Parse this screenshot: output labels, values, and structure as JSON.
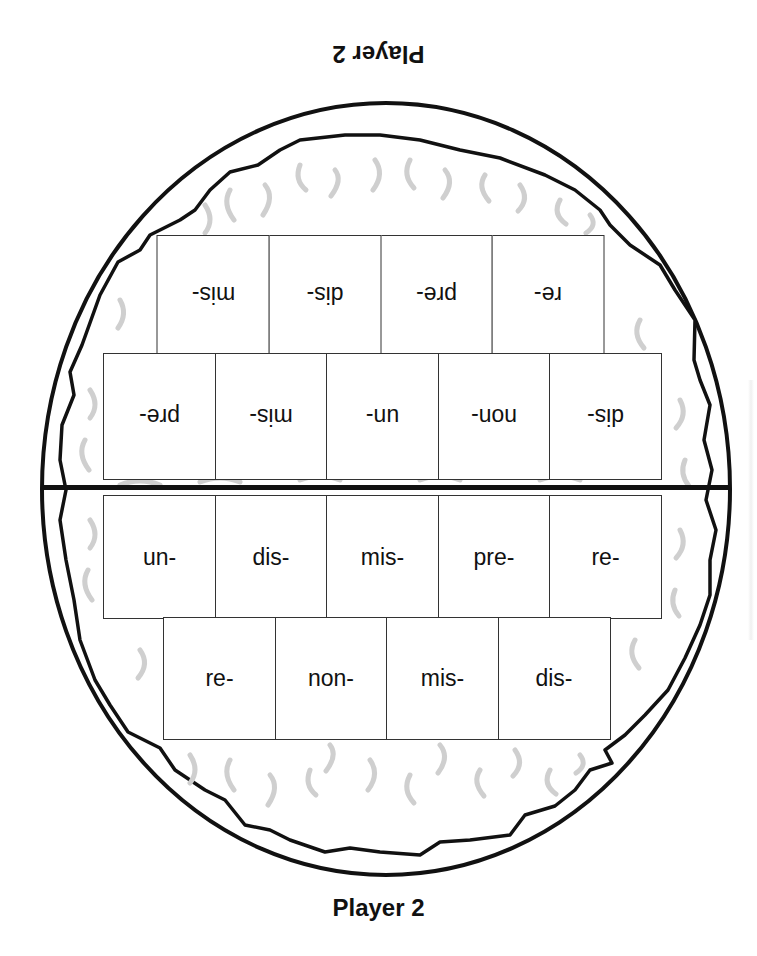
{
  "board": {
    "top_player_label": "Player 2",
    "bottom_player_label": "Player 2",
    "colors": {
      "outline": "#111111",
      "steam": "#cfcfcf",
      "tile_border": "#333333",
      "background": "#ffffff"
    },
    "top_side": {
      "orientation": "upside-down",
      "rows": [
        {
          "tiles": [
            "re-",
            "pre-",
            "dis-",
            "mis-"
          ]
        },
        {
          "tiles": [
            "dis-",
            "non-",
            "un-",
            "mis-",
            "pre-"
          ]
        }
      ]
    },
    "bottom_side": {
      "orientation": "upright",
      "rows": [
        {
          "tiles": [
            "un-",
            "dis-",
            "mis-",
            "pre-",
            "re-"
          ]
        },
        {
          "tiles": [
            "re-",
            "non-",
            "mis-",
            "dis-"
          ]
        }
      ]
    }
  }
}
